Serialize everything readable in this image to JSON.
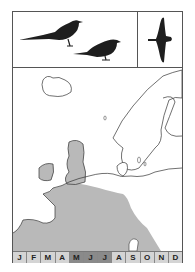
{
  "figure": {
    "type": "bird-field-guide-range-card",
    "header": {
      "perched_silhouettes": [
        "long-tailed-bird-silhouette",
        "short-tailed-bird-silhouette"
      ],
      "flight_silhouette": "bird-in-flight-silhouette"
    },
    "map": {
      "region": "Europe",
      "range_color": "#b9b9b9",
      "coast_color": "#333333"
    },
    "months": [
      {
        "label": "J",
        "active": false
      },
      {
        "label": "F",
        "active": false
      },
      {
        "label": "M",
        "active": false
      },
      {
        "label": "A",
        "active": false
      },
      {
        "label": "M",
        "active": true
      },
      {
        "label": "J",
        "active": true
      },
      {
        "label": "J",
        "active": true
      },
      {
        "label": "A",
        "active": false
      },
      {
        "label": "S",
        "active": false
      },
      {
        "label": "O",
        "active": false
      },
      {
        "label": "N",
        "active": false
      },
      {
        "label": "D",
        "active": false
      }
    ],
    "colors": {
      "month_inactive": "#d4d4d4",
      "month_active": "#8a8a8a"
    }
  }
}
